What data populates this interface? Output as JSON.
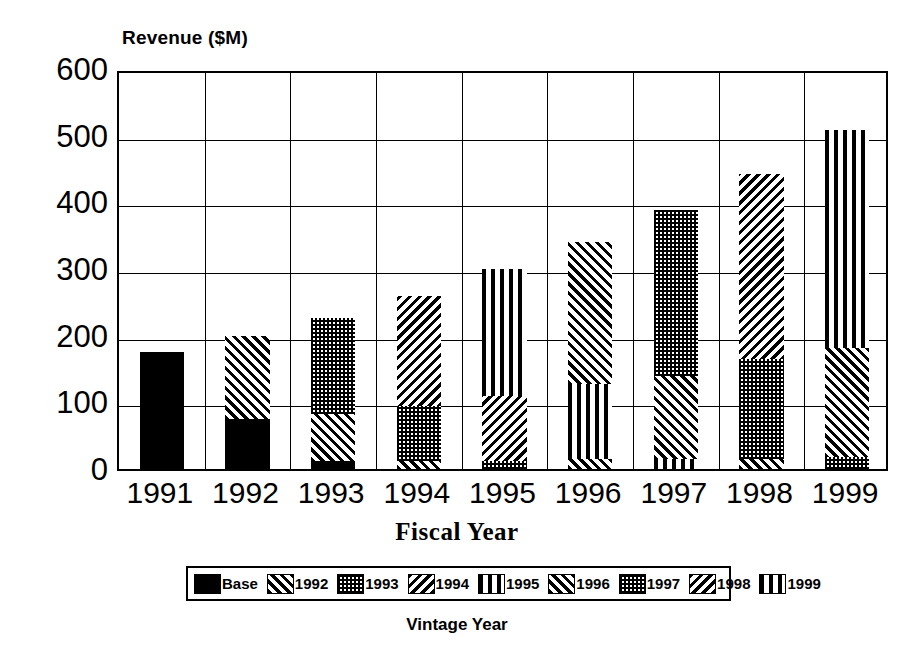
{
  "chart_data": {
    "type": "bar",
    "subtype": "stacked",
    "title": "",
    "ylabel": "Revenue ($M)",
    "xlabel": "Fiscal Year",
    "legend_title": "Vintage Year",
    "legend_position": "bottom",
    "grid": true,
    "ylim": [
      0,
      600
    ],
    "ytick_values": [
      0,
      100,
      200,
      300,
      400,
      500,
      600
    ],
    "ytick_labels": [
      "0",
      "100",
      "200",
      "300",
      "400",
      "500",
      "600"
    ],
    "categories": [
      "1991",
      "1992",
      "1993",
      "1994",
      "1995",
      "1996",
      "1997",
      "1998",
      "1999"
    ],
    "series": [
      {
        "name": "Base",
        "pattern": "solid-black",
        "values": [
          175,
          75,
          12,
          0,
          0,
          0,
          0,
          0,
          0
        ]
      },
      {
        "name": "1992",
        "pattern": "forward-diagonal",
        "values": [
          0,
          125,
          70,
          0,
          0,
          0,
          0,
          0,
          0
        ]
      },
      {
        "name": "1993",
        "pattern": "checkered",
        "values": [
          0,
          0,
          145,
          12,
          0,
          0,
          0,
          0,
          0
        ]
      },
      {
        "name": "1994",
        "pattern": "backward-diagonal",
        "values": [
          0,
          0,
          0,
          83,
          0,
          0,
          0,
          0,
          0
        ]
      },
      {
        "name": "1995",
        "pattern": "vertical",
        "values": [
          0,
          0,
          0,
          165,
          12,
          0,
          0,
          0,
          0
        ]
      },
      {
        "name": "1996",
        "pattern": "forward-diagonal",
        "values": [
          0,
          0,
          0,
          0,
          98,
          15,
          0,
          0,
          0
        ]
      },
      {
        "name": "1997",
        "pattern": "checkered",
        "values": [
          0,
          0,
          0,
          0,
          190,
          113,
          15,
          0,
          0
        ]
      },
      {
        "name": "1998",
        "pattern": "backward-diagonal",
        "values": [
          0,
          0,
          0,
          0,
          0,
          212,
          125,
          15,
          0
        ]
      },
      {
        "name": "1999",
        "pattern": "vertical",
        "values": [
          0,
          0,
          0,
          0,
          0,
          0,
          248,
          150,
          18
        ]
      }
    ],
    "bar_stacks": [
      {
        "category": "1991",
        "total": 175,
        "segments": [
          {
            "series": "Base",
            "pattern": "solid-black",
            "from": 0,
            "to": 175
          }
        ]
      },
      {
        "category": "1992",
        "total": 200,
        "segments": [
          {
            "series": "Base",
            "pattern": "solid-black",
            "from": 0,
            "to": 75
          },
          {
            "series": "1992",
            "pattern": "forward-diagonal",
            "from": 75,
            "to": 200
          }
        ]
      },
      {
        "category": "1993",
        "total": 227,
        "segments": [
          {
            "series": "Base",
            "pattern": "solid-black",
            "from": 0,
            "to": 12
          },
          {
            "series": "1992",
            "pattern": "forward-diagonal",
            "from": 12,
            "to": 82
          },
          {
            "series": "1993",
            "pattern": "checkered",
            "from": 82,
            "to": 227
          }
        ]
      },
      {
        "category": "1994",
        "total": 260,
        "segments": [
          {
            "series": "1993",
            "pattern": "forward-diagonal",
            "from": 0,
            "to": 12
          },
          {
            "series": "1994",
            "pattern": "checkered",
            "from": 12,
            "to": 95
          },
          {
            "series": "1995",
            "pattern": "backward-diagonal",
            "from": 95,
            "to": 260
          }
        ]
      },
      {
        "category": "1995",
        "total": 300,
        "segments": [
          {
            "series": "1994",
            "pattern": "checkered",
            "from": 0,
            "to": 12
          },
          {
            "series": "1995",
            "pattern": "backward-diagonal",
            "from": 12,
            "to": 110
          },
          {
            "series": "1996",
            "pattern": "vertical",
            "from": 110,
            "to": 300
          }
        ]
      },
      {
        "category": "1996",
        "total": 340,
        "segments": [
          {
            "series": "1995",
            "pattern": "forward-diagonal",
            "from": 0,
            "to": 15
          },
          {
            "series": "1996",
            "pattern": "vertical",
            "from": 15,
            "to": 128
          },
          {
            "series": "1997",
            "pattern": "forward-diagonal",
            "from": 128,
            "to": 340
          }
        ]
      },
      {
        "category": "1997",
        "total": 388,
        "segments": [
          {
            "series": "1996",
            "pattern": "vertical",
            "from": 0,
            "to": 15
          },
          {
            "series": "1997",
            "pattern": "forward-diagonal",
            "from": 15,
            "to": 140
          },
          {
            "series": "1998",
            "pattern": "checkered",
            "from": 140,
            "to": 388
          }
        ]
      },
      {
        "category": "1998",
        "total": 443,
        "segments": [
          {
            "series": "1997",
            "pattern": "forward-diagonal",
            "from": 0,
            "to": 15
          },
          {
            "series": "1998",
            "pattern": "checkered",
            "from": 15,
            "to": 165
          },
          {
            "series": "1999",
            "pattern": "backward-diagonal",
            "from": 165,
            "to": 443
          }
        ]
      },
      {
        "category": "1999",
        "total": 508,
        "segments": [
          {
            "series": "1998",
            "pattern": "checkered",
            "from": 0,
            "to": 18
          },
          {
            "series": "1999",
            "pattern": "forward-diagonal",
            "from": 18,
            "to": 182
          },
          {
            "series": "2000",
            "pattern": "vertical",
            "from": 182,
            "to": 508
          }
        ]
      }
    ],
    "legend_entries": [
      {
        "label": "Base",
        "pattern": "solid-black"
      },
      {
        "label": "1992",
        "pattern": "forward-diagonal"
      },
      {
        "label": "1993",
        "pattern": "checkered"
      },
      {
        "label": "1994",
        "pattern": "backward-diagonal"
      },
      {
        "label": "1995",
        "pattern": "vertical"
      },
      {
        "label": "1996",
        "pattern": "forward-diagonal"
      },
      {
        "label": "1997",
        "pattern": "checkered"
      },
      {
        "label": "1998",
        "pattern": "backward-diagonal"
      },
      {
        "label": "1999",
        "pattern": "vertical"
      }
    ],
    "colors": {
      "foreground": "#000000",
      "background": "#ffffff"
    }
  }
}
